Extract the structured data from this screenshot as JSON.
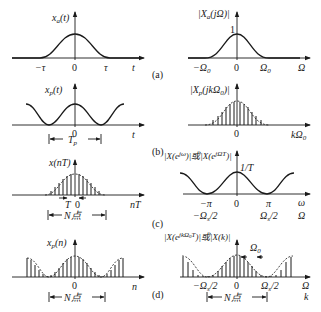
{
  "figure": {
    "panels": [
      {
        "id": "a",
        "caption": "(a)",
        "left": {
          "ylabel": "x",
          "ylabel_sub": "a",
          "ylabel_tail": "(t)",
          "ticks": [
            "−τ",
            "0",
            "τ"
          ],
          "xlabel": "t"
        },
        "right": {
          "ylabel": "|X",
          "ylabel_sub": "a",
          "ylabel_tail": "(jΩ)|",
          "peak": "1",
          "ticks": [
            "−Ω",
            "0",
            "Ω"
          ],
          "tick_sub": "0",
          "xlabel": "Ω"
        }
      },
      {
        "id": "b",
        "caption": "(b)",
        "left": {
          "ylabel": "x",
          "ylabel_sub": "p",
          "ylabel_tail": "(t)",
          "origin": "0",
          "xlabel": "t",
          "period": "T",
          "period_sub": "p"
        },
        "right": {
          "ylabel": "|X",
          "ylabel_sub": "p",
          "ylabel_tail": "(jkΩ",
          "ylabel_sub2": "0",
          "ylabel_tail2": ")|",
          "origin": "0",
          "xlabel": "kΩ",
          "xlabel_sub": "0"
        }
      },
      {
        "id": "c",
        "caption": "(c)",
        "left": {
          "ylabel": "x(nT)",
          "sample_label": "T",
          "origin": "0",
          "xlabel": "nT",
          "span": "N点"
        },
        "right": {
          "ylabel": "|X(e",
          "ylabel_sup": "jω",
          "ylabel_mid": ")|或|X(e",
          "ylabel_sup2": "jΩT",
          "ylabel_tail": ")|",
          "peak": "1/T",
          "ticks_top": [
            "−π",
            "0",
            "π",
            "ω"
          ],
          "ticks_bottom": [
            "−Ω",
            "Ω",
            "Ω"
          ],
          "ticks_bottom_sub": "s",
          "ticks_bottom_tail": "/2"
        }
      },
      {
        "id": "d",
        "caption": "(d)",
        "left": {
          "ylabel": "x",
          "ylabel_sub": "p",
          "ylabel_tail": "(n)",
          "origin": "0",
          "xlabel": "n",
          "span": "N点"
        },
        "right": {
          "ylabel": "|X(e",
          "ylabel_sup": "jkΩ",
          "ylabel_sup_sub": "0",
          "ylabel_sup_tail": "T",
          "ylabel_tail": ")|或|X(k)|",
          "spacing": "Ω",
          "spacing_sub": "0",
          "ticks": [
            "−Ω",
            "0",
            "Ω"
          ],
          "ticks_sub": "s",
          "ticks_tail": "/2",
          "xlabel_top": "Ω",
          "xlabel_bottom": "k",
          "span": "N点"
        }
      }
    ]
  }
}
